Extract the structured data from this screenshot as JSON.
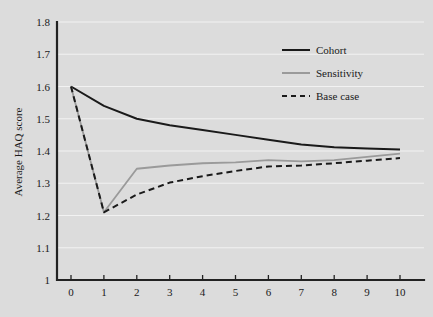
{
  "figure": {
    "background_color": "#dcdcdc",
    "plot_background_color": "#dcdcdc",
    "gridline_color": "#f2f2f2",
    "axis_color": "#222222"
  },
  "chart_data": {
    "type": "line",
    "title": "",
    "xlabel": "",
    "ylabel": "Average HAQ score",
    "xlim": [
      0,
      10
    ],
    "ylim": [
      1,
      1.8
    ],
    "xticks": [
      "0",
      "1",
      "2",
      "3",
      "4",
      "5",
      "6",
      "7",
      "8",
      "9",
      "10"
    ],
    "yticks": [
      "1",
      "1.1",
      "1.2",
      "1.3",
      "1.4",
      "1.5",
      "1.6",
      "1.7",
      "1.8"
    ],
    "grid": "horizontal",
    "legend_position": "top-right",
    "x": [
      0,
      1,
      2,
      3,
      4,
      5,
      6,
      7,
      8,
      9,
      10
    ],
    "series": [
      {
        "name": "Cohort",
        "color": "#1a1a1a",
        "style": "solid",
        "width": 2.0,
        "values": [
          1.6,
          1.54,
          1.5,
          1.48,
          1.465,
          1.45,
          1.435,
          1.42,
          1.412,
          1.408,
          1.405
        ]
      },
      {
        "name": "Sensitivity",
        "color": "#9a9a9a",
        "style": "solid",
        "width": 1.8,
        "values": [
          1.6,
          1.21,
          1.345,
          1.355,
          1.362,
          1.365,
          1.372,
          1.368,
          1.372,
          1.382,
          1.392
        ]
      },
      {
        "name": "Base case",
        "color": "#1a1a1a",
        "style": "dashed",
        "width": 2.0,
        "values": [
          1.6,
          1.21,
          1.265,
          1.302,
          1.322,
          1.338,
          1.352,
          1.355,
          1.362,
          1.37,
          1.378
        ]
      }
    ]
  },
  "legend": {
    "entries": [
      {
        "label": "Cohort",
        "color": "#1a1a1a",
        "style": "solid"
      },
      {
        "label": "Sensitivity",
        "color": "#9a9a9a",
        "style": "solid"
      },
      {
        "label": "Base case",
        "color": "#1a1a1a",
        "style": "dashed"
      }
    ]
  }
}
